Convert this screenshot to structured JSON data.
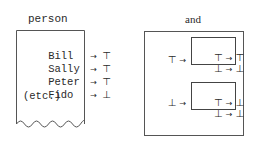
{
  "panels": {
    "person": {
      "title": "person",
      "rows": [
        {
          "name": "Bill",
          "arrow": "→",
          "value": "⊤"
        },
        {
          "name": "Sally",
          "arrow": "→",
          "value": "⊤"
        },
        {
          "name": "Peter",
          "arrow": "→",
          "value": "⊤"
        },
        {
          "name": "Fido",
          "arrow": "→",
          "value": "⊥"
        }
      ],
      "etc": "(etc.)"
    },
    "and": {
      "title": "and",
      "cases": [
        {
          "input": "⊤",
          "arrow": "→",
          "table": [
            {
              "in": "⊤",
              "arrow": "→",
              "out": "⊤"
            },
            {
              "in": "⊥",
              "arrow": "→",
              "out": "⊥"
            }
          ]
        },
        {
          "input": "⊥",
          "arrow": "→",
          "table": [
            {
              "in": "⊤",
              "arrow": "→",
              "out": "⊥"
            },
            {
              "in": "⊥",
              "arrow": "→",
              "out": "⊥"
            }
          ]
        }
      ]
    }
  }
}
